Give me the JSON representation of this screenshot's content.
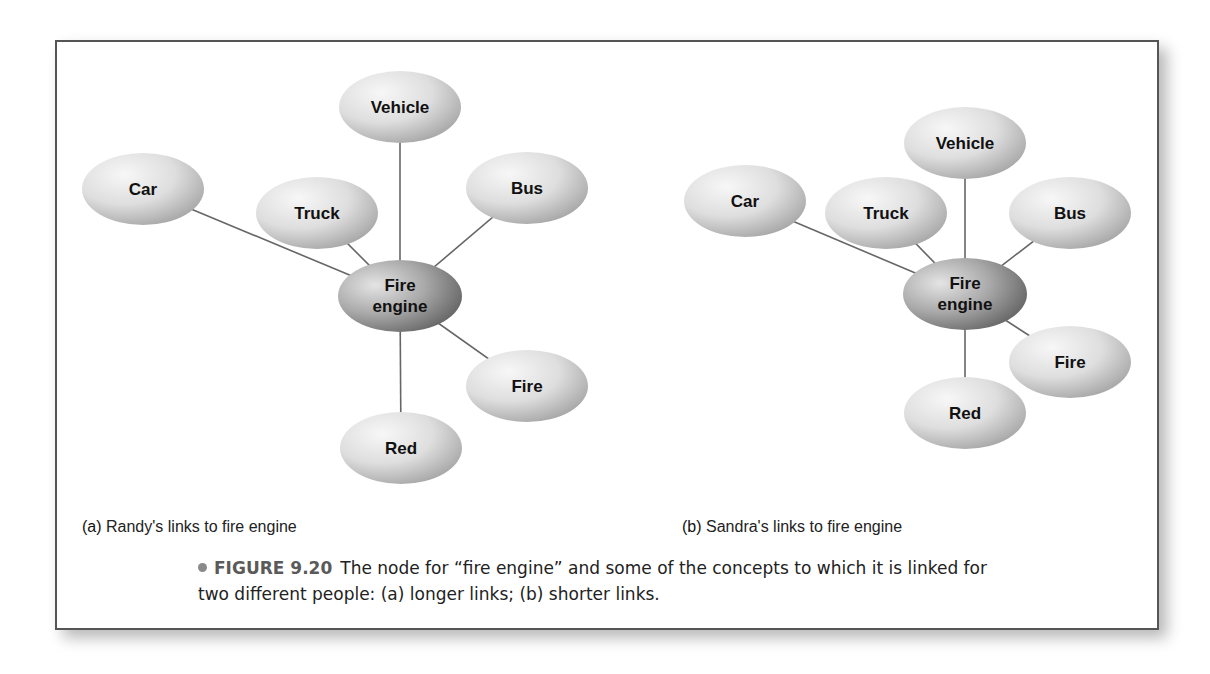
{
  "colors": {
    "frame_border": "#555555",
    "link_line": "#666666",
    "node_light": "#f2f2f2",
    "node_shade": "#a9a9a9",
    "center_light": "#d9d9d9",
    "center_shade": "#6f6f6f",
    "figure_number": "#5a5a5a",
    "bullet": "#8a8a8a"
  },
  "diagrams": [
    {
      "id": "a",
      "tag": "(a)",
      "label": "Randy's links to fire engine",
      "center": {
        "line1": "Fire",
        "line2": "engine",
        "cx": 400,
        "cy": 296
      },
      "nodes": [
        {
          "label": "Vehicle",
          "cx": 400,
          "cy": 107
        },
        {
          "label": "Car",
          "cx": 143,
          "cy": 189
        },
        {
          "label": "Truck",
          "cx": 317,
          "cy": 213
        },
        {
          "label": "Bus",
          "cx": 527,
          "cy": 188
        },
        {
          "label": "Fire",
          "cx": 527,
          "cy": 386
        },
        {
          "label": "Red",
          "cx": 401,
          "cy": 448
        }
      ]
    },
    {
      "id": "b",
      "tag": "(b)",
      "label": "Sandra's links to fire engine",
      "center": {
        "line1": "Fire",
        "line2": "engine",
        "cx": 965,
        "cy": 294
      },
      "nodes": [
        {
          "label": "Vehicle",
          "cx": 965,
          "cy": 143
        },
        {
          "label": "Car",
          "cx": 745,
          "cy": 201
        },
        {
          "label": "Truck",
          "cx": 886,
          "cy": 213
        },
        {
          "label": "Bus",
          "cx": 1070,
          "cy": 213
        },
        {
          "label": "Fire",
          "cx": 1070,
          "cy": 362
        },
        {
          "label": "Red",
          "cx": 965,
          "cy": 413
        }
      ]
    }
  ],
  "caption": {
    "figure_number": "FIGURE 9.20",
    "line1": "The node for “fire engine” and some of the concepts to which it is linked for",
    "line2": "two different people: (a) longer links; (b) shorter links."
  }
}
